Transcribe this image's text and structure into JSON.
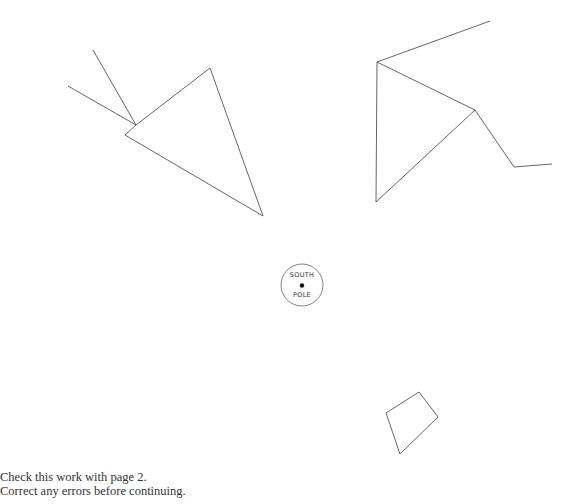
{
  "diagram": {
    "pole": {
      "line1": "SOUTH",
      "line2": "POLE",
      "center": [
        302,
        285
      ],
      "radius": 21
    },
    "shapes": [
      {
        "name": "left-triangle",
        "points": [
          [
            136,
            125
          ],
          [
            210,
            68
          ],
          [
            263,
            216
          ],
          [
            125,
            135
          ],
          [
            136,
            125
          ]
        ]
      },
      {
        "name": "left-ray-1",
        "points": [
          [
            93,
            50
          ],
          [
            136,
            125
          ]
        ]
      },
      {
        "name": "left-ray-2",
        "points": [
          [
            68,
            86
          ],
          [
            136,
            125
          ]
        ]
      },
      {
        "name": "right-figure-upper",
        "points": [
          [
            490,
            21
          ],
          [
            377,
            62
          ],
          [
            475,
            110
          ],
          [
            514,
            167
          ],
          [
            552,
            164
          ]
        ]
      },
      {
        "name": "right-triangle",
        "points": [
          [
            377,
            62
          ],
          [
            376,
            202
          ],
          [
            475,
            110
          ]
        ]
      },
      {
        "name": "bottom-quad",
        "points": [
          [
            419,
            392
          ],
          [
            438,
            417
          ],
          [
            400,
            454
          ],
          [
            386,
            413
          ],
          [
            419,
            392
          ]
        ]
      }
    ],
    "stroke_color": "#555555"
  },
  "caption": {
    "line1": "Check this work with page 2.",
    "line2": "Correct any errors before continuing."
  }
}
